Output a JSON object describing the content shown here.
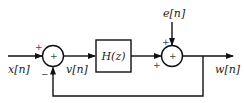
{
  "diagram": {
    "type": "block-diagram",
    "nodes": {
      "input": {
        "label": "x[n]"
      },
      "summer1": {
        "center_symbol": "+",
        "input_signs": {
          "left": "+",
          "bottom": "−"
        }
      },
      "intermediate": {
        "label": "v[n]"
      },
      "block": {
        "label": "H(z)"
      },
      "disturbance": {
        "label": "e[n]"
      },
      "summer2": {
        "center_symbol": "+",
        "input_signs": {
          "top": "+",
          "left": "+"
        }
      },
      "output": {
        "label": "w[n]"
      }
    },
    "edges": [
      {
        "from": "input",
        "to": "summer1",
        "sign": "+"
      },
      {
        "from": "summer1",
        "to": "block",
        "label": "v[n]"
      },
      {
        "from": "block",
        "to": "summer2",
        "sign": "+"
      },
      {
        "from": "disturbance",
        "to": "summer2",
        "sign": "+"
      },
      {
        "from": "summer2",
        "to": "output",
        "label": "w[n]"
      },
      {
        "from": "output",
        "to": "summer1",
        "sign": "−",
        "type": "feedback"
      }
    ],
    "colors": {
      "line": "#111111",
      "text": "#222222",
      "background": "#ffffff"
    }
  }
}
